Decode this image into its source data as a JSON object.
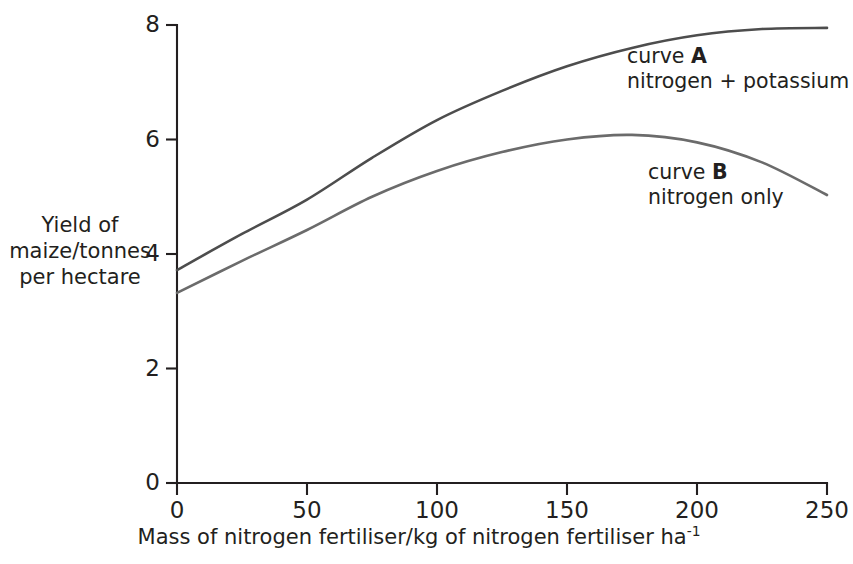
{
  "chart_data": {
    "type": "line",
    "title": "",
    "subtitle": "",
    "xlabel": "Mass of nitrogen fertiliser/kg of nitrogen fertiliser ha",
    "xlabel_exponent": "-1",
    "ylabel_lines": [
      "Yield of",
      "maize/tonnes",
      "per hectare"
    ],
    "xlim": [
      0,
      250
    ],
    "ylim": [
      0,
      8
    ],
    "xticks": [
      0,
      50,
      100,
      150,
      200,
      250
    ],
    "yticks": [
      0,
      2,
      4,
      6,
      8
    ],
    "xtick_labels": [
      "0",
      "50",
      "100",
      "150",
      "200",
      "250"
    ],
    "ytick_labels": [
      "0",
      "2",
      "4",
      "6",
      "8"
    ],
    "grid": false,
    "legend_position": "inline-annotations",
    "series": [
      {
        "name": "curve A",
        "description": "nitrogen + potassium",
        "color": "#4d4d4d",
        "x": [
          0,
          25,
          50,
          75,
          100,
          125,
          150,
          175,
          200,
          225,
          250
        ],
        "values": [
          3.72,
          4.35,
          4.95,
          5.68,
          6.34,
          6.85,
          7.28,
          7.6,
          7.82,
          7.93,
          7.95
        ]
      },
      {
        "name": "curve B",
        "description": "nitrogen only",
        "color": "#6b6b6b",
        "x": [
          0,
          25,
          50,
          75,
          100,
          125,
          150,
          175,
          200,
          225,
          250
        ],
        "values": [
          3.32,
          3.88,
          4.42,
          5.0,
          5.45,
          5.78,
          6.0,
          6.08,
          5.95,
          5.6,
          5.03
        ]
      }
    ]
  },
  "annotations": {
    "curve_a": {
      "line1_prefix": "curve ",
      "line1_bold": "A",
      "line2": "nitrogen + potassium"
    },
    "curve_b": {
      "line1_prefix": "curve ",
      "line1_bold": "B",
      "line2": "nitrogen only"
    }
  },
  "colors": {
    "axis": "#231f20",
    "text": "#231f20",
    "curve_a": "#4d4d4d",
    "curve_b": "#6b6b6b",
    "background": "#ffffff"
  }
}
